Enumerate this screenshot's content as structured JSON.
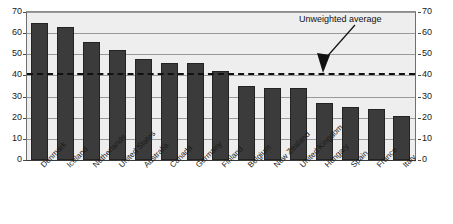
{
  "chart_data": {
    "type": "bar",
    "title": "",
    "xlabel": "",
    "ylabel": "",
    "ylim": [
      0,
      70
    ],
    "ytick_step": 10,
    "grid": true,
    "legend": null,
    "categories": [
      "Denmark",
      "Iceland",
      "Netherlands",
      "United States",
      "Australia",
      "Canada",
      "Germany",
      "Finland",
      "Belgium",
      "New Zealand",
      "United Kingdom",
      "Hungary",
      "Spain",
      "France",
      "Italy"
    ],
    "values": [
      65,
      63,
      56,
      52,
      48,
      46,
      46,
      42,
      35,
      34,
      34,
      27,
      25,
      24,
      21
    ],
    "yticks_left": [
      "70",
      "60",
      "50",
      "40",
      "30",
      "20",
      "10",
      "0"
    ],
    "yticks_right": [
      "70",
      "60",
      "50",
      "40",
      "30",
      "20",
      "10",
      "0"
    ],
    "annotations": [
      {
        "text": "Unweighted average",
        "value": 41,
        "style": "dashed-horizontal-line-with-arrow"
      }
    ],
    "colors": {
      "bar": "#3b3b3b",
      "bar_border": "#232323",
      "plot_background": "#eeeeee",
      "gridline": "#9a9a9a",
      "axis": "#3a3a3a",
      "average_line": "#101010",
      "text": "#1a1a1a"
    }
  }
}
